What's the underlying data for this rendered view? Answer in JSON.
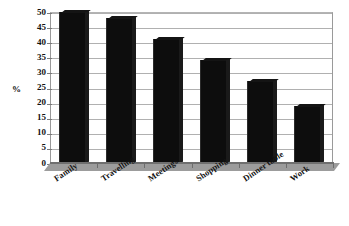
{
  "chart_data": {
    "type": "bar",
    "title": "",
    "subtitle": "",
    "xlabel": "",
    "ylabel": "%",
    "ylim": [
      0,
      50
    ],
    "ytick_step": 5,
    "grid": true,
    "legend": false,
    "legend_position": "none",
    "orientation": "vertical",
    "bar_color": "#0d0d0d",
    "plot_background": "#ffffff",
    "gridline_color": "#b0b0b0",
    "floor_color": "#9c9c9c",
    "categories": [
      "Family",
      "Travelling",
      "Meetings",
      "Shopping",
      "Dinner table",
      "Work"
    ],
    "values": [
      50,
      48,
      41,
      34,
      27,
      19
    ],
    "yticks": [
      "0",
      "5",
      "10",
      "15",
      "20",
      "25",
      "30",
      "35",
      "40",
      "45",
      "50"
    ],
    "annotations": []
  },
  "axis": {
    "y_title": "%"
  },
  "ticks": {
    "y": [
      {
        "label": "50",
        "value": 50
      },
      {
        "label": "45",
        "value": 45
      },
      {
        "label": "40",
        "value": 40
      },
      {
        "label": "35",
        "value": 35
      },
      {
        "label": "30",
        "value": 30
      },
      {
        "label": "25",
        "value": 25
      },
      {
        "label": "20",
        "value": 20
      },
      {
        "label": "15",
        "value": 15
      },
      {
        "label": "10",
        "value": 10
      },
      {
        "label": "5",
        "value": 5
      },
      {
        "label": "0",
        "value": 0
      }
    ]
  },
  "bars": [
    {
      "label": "Family",
      "value": 50
    },
    {
      "label": "Travelling",
      "value": 48
    },
    {
      "label": "Meetings",
      "value": 41
    },
    {
      "label": "Shopping",
      "value": 34
    },
    {
      "label": "Dinner table",
      "value": 27
    },
    {
      "label": "Work",
      "value": 19
    }
  ]
}
